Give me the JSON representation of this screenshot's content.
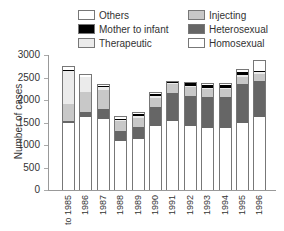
{
  "chart_data": {
    "type": "bar",
    "stacked": true,
    "title": "",
    "xlabel": "",
    "ylabel": "Number of cases",
    "ylim": [
      0,
      3000
    ],
    "yticks": [
      0,
      500,
      1000,
      1500,
      2000,
      2500,
      3000
    ],
    "grid": false,
    "legend_position": "top",
    "categories": [
      "to 1985",
      "1986",
      "1987",
      "1988",
      "1989",
      "1990",
      "1991",
      "1992",
      "1993",
      "1994",
      "1995",
      "1996"
    ],
    "series": [
      {
        "name": "Homosexual",
        "color": "#ffffff",
        "values": [
          1490,
          1615,
          1570,
          1100,
          1125,
          1420,
          1540,
          1420,
          1385,
          1385,
          1480,
          1620
        ]
      },
      {
        "name": "Heterosexual",
        "color": "#666666",
        "values": [
          40,
          125,
          220,
          210,
          275,
          430,
          610,
          680,
          675,
          675,
          865,
          800
        ]
      },
      {
        "name": "Injecting",
        "color": "#c8c8c8",
        "values": [
          380,
          430,
          430,
          220,
          205,
          200,
          205,
          190,
          185,
          185,
          170,
          160
        ]
      },
      {
        "name": "Therapeutic",
        "color": "#ebebeb",
        "values": [
          740,
          340,
          75,
          30,
          45,
          40,
          20,
          25,
          30,
          30,
          45,
          40
        ]
      },
      {
        "name": "Mother to infant",
        "color": "#000000",
        "values": [
          10,
          10,
          10,
          20,
          40,
          50,
          35,
          55,
          65,
          65,
          55,
          25
        ]
      },
      {
        "name": "Others",
        "color": "#ffffff",
        "values": [
          100,
          60,
          50,
          65,
          40,
          40,
          20,
          30,
          45,
          45,
          80,
          250
        ]
      }
    ]
  },
  "legend": [
    {
      "label": "Others",
      "color": "#ffffff"
    },
    {
      "label": "Mother to infant",
      "color": "#000000"
    },
    {
      "label": "Therapeutic",
      "color": "#ebebeb"
    },
    {
      "label": "Injecting",
      "color": "#c8c8c8"
    },
    {
      "label": "Heterosexual",
      "color": "#666666"
    },
    {
      "label": "Homosexual",
      "color": "#ffffff"
    }
  ]
}
